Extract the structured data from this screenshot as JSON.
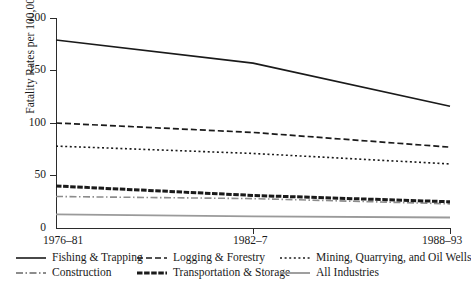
{
  "chart_data": {
    "type": "line",
    "title": "",
    "xlabel": "",
    "ylabel": "Fatality Rates per 100,000",
    "categories": [
      "1976–81",
      "1982–7",
      "1988–93"
    ],
    "ylim": [
      0,
      200
    ],
    "yticks": [
      0,
      50,
      100,
      150,
      200
    ],
    "grid": false,
    "legend_position": "bottom",
    "series": [
      {
        "name": "Fishing & Trapping",
        "values": [
          179,
          157,
          116
        ],
        "style": "solid",
        "color": "#1a1a1a",
        "width": 1.6
      },
      {
        "name": "Logging & Forestry",
        "values": [
          100,
          91,
          77
        ],
        "style": "dashed",
        "color": "#1a1a1a",
        "width": 1.7
      },
      {
        "name": "Mining, Quarrying, and Oil Wells",
        "values": [
          78,
          71,
          61
        ],
        "style": "dotted",
        "color": "#1a1a1a",
        "width": 1.6
      },
      {
        "name": "Construction",
        "values": [
          30,
          28,
          23
        ],
        "style": "dash-dot",
        "color": "#8c8c8c",
        "width": 1.6
      },
      {
        "name": "Transportation & Storage",
        "values": [
          40,
          31,
          25
        ],
        "style": "thick-dashed",
        "color": "#1a1a1a",
        "width": 3.0
      },
      {
        "name": "All Industries",
        "values": [
          13,
          11,
          10
        ],
        "style": "solid",
        "color": "#9a9a9a",
        "width": 1.8
      }
    ]
  },
  "axis": {
    "y_title": "Fatality Rates per 100,000",
    "y_tick_labels": [
      "200",
      "150",
      "100",
      "50",
      "0"
    ],
    "x_tick_labels": [
      "1976–81",
      "1982–7",
      "1988–93"
    ]
  },
  "legend": {
    "entries": [
      {
        "label": "Fishing & Trapping"
      },
      {
        "label": "Logging & Forestry"
      },
      {
        "label": "Mining, Quarrying, and Oil Wells"
      },
      {
        "label": "Construction"
      },
      {
        "label": "Transportation & Storage"
      },
      {
        "label": "All Industries"
      }
    ]
  }
}
